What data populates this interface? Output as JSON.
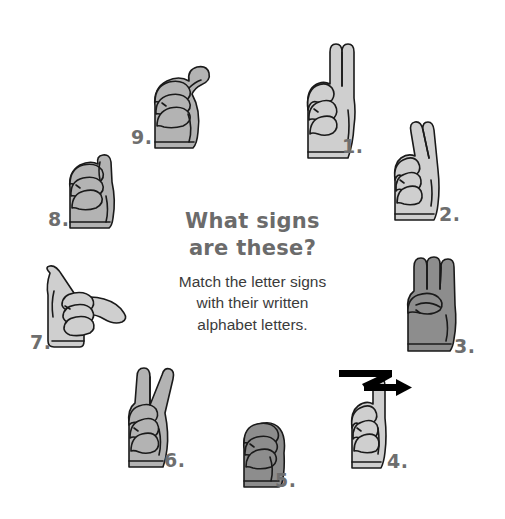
{
  "page": {
    "background_color": "#ffffff",
    "width": 505,
    "height": 519
  },
  "center": {
    "title_line_1": "What signs",
    "title_line_2": "are these?",
    "title_color": "#6b6b6b",
    "subtitle_line_1": "Match the letter signs",
    "subtitle_line_2": "with their written",
    "subtitle_line_3": "alphabet letters.",
    "subtitle_color": "#3b3b3b"
  },
  "style": {
    "hand_light_fill": "#cfcfcf",
    "hand_mid_fill": "#b3b3b3",
    "hand_dark_fill": "#8d8d8d",
    "hand_outline": "#1a1a1a",
    "number_color": "#6e6e6e",
    "arrow_color": "#000000"
  },
  "signs": [
    {
      "id": 1,
      "number_label": "1.",
      "icon": "asl-hand-sign-u-icon",
      "description": "two fingers held up together, other fingers curled",
      "fill": "#cfcfcf"
    },
    {
      "id": 2,
      "number_label": "2.",
      "icon": "asl-hand-sign-r-icon",
      "description": "index and middle finger crossed and raised",
      "fill": "#cfcfcf"
    },
    {
      "id": 3,
      "number_label": "3.",
      "icon": "asl-hand-sign-w-icon",
      "description": "three fingers raised and spread",
      "fill": "#8d8d8d"
    },
    {
      "id": 4,
      "number_label": "4.",
      "icon": "asl-hand-sign-z-icon",
      "description": "index finger raised tracing a Z, with black zigzag motion arrow",
      "fill": "#cfcfcf",
      "has_motion_arrow": true
    },
    {
      "id": 5,
      "number_label": "5.",
      "icon": "asl-hand-sign-s-icon",
      "description": "closed fist",
      "fill": "#8d8d8d"
    },
    {
      "id": 6,
      "number_label": "6.",
      "icon": "asl-hand-sign-v-icon",
      "description": "index and middle finger raised in a V",
      "fill": "#b3b3b3"
    },
    {
      "id": 7,
      "number_label": "7.",
      "icon": "asl-hand-sign-y-icon",
      "description": "thumb and pinky extended, hand sideways",
      "fill": "#cfcfcf"
    },
    {
      "id": 8,
      "number_label": "8.",
      "icon": "asl-hand-sign-x-icon",
      "description": "index finger bent into a hook",
      "fill": "#b3b3b3"
    },
    {
      "id": 9,
      "number_label": "9.",
      "icon": "asl-hand-sign-t-icon",
      "description": "fist with thumb crossing between fingers",
      "fill": "#b3b3b3"
    }
  ]
}
